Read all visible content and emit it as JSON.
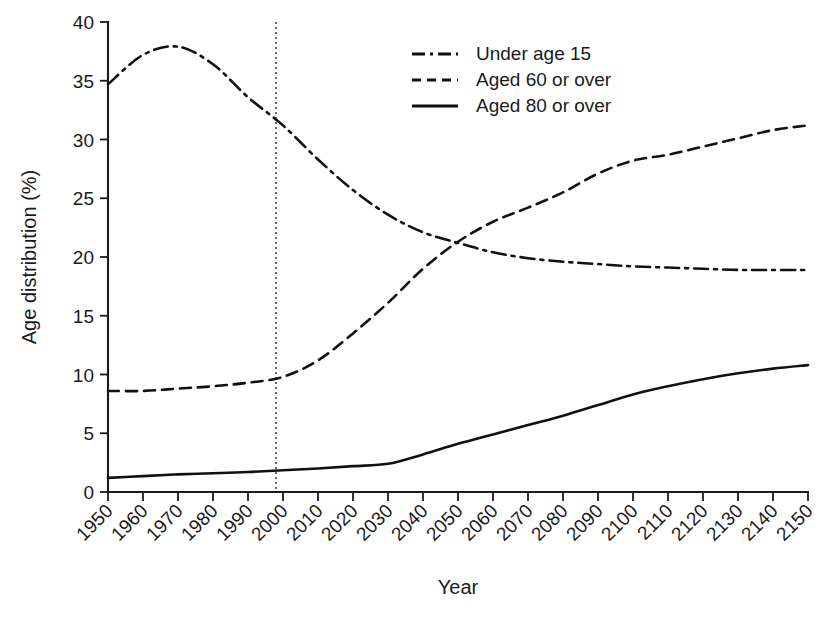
{
  "chart_data": {
    "type": "line",
    "title": "",
    "xlabel": "Year",
    "ylabel": "Age distribution (%)",
    "xlim": [
      1950,
      2150
    ],
    "ylim": [
      0,
      40
    ],
    "yticks": [
      0,
      5,
      10,
      15,
      20,
      25,
      30,
      35,
      40
    ],
    "ytick_labels": [
      "0",
      "5",
      "10",
      "15",
      "20",
      "25",
      "30",
      "35",
      "40"
    ],
    "xticks": [
      1950,
      1960,
      1970,
      1980,
      1990,
      2000,
      2010,
      2020,
      2030,
      2040,
      2050,
      2060,
      2070,
      2080,
      2090,
      2100,
      2110,
      2120,
      2130,
      2140,
      2150
    ],
    "xtick_labels": [
      "1950",
      "1960",
      "1970",
      "1980",
      "1990",
      "2000",
      "2010",
      "2020",
      "2030",
      "2040",
      "2050",
      "2060",
      "2070",
      "2080",
      "2090",
      "2100",
      "2110",
      "2120",
      "2130",
      "2140",
      "2150"
    ],
    "grid": false,
    "legend_position": "top-right",
    "annotations": [
      {
        "name": "present-year-marker",
        "type": "vline",
        "x": 1998,
        "style": "dotted"
      }
    ],
    "x": [
      1950,
      1960,
      1970,
      1980,
      1990,
      2000,
      2010,
      2020,
      2030,
      2040,
      2050,
      2060,
      2070,
      2080,
      2090,
      2100,
      2110,
      2120,
      2130,
      2140,
      2150
    ],
    "series": [
      {
        "name": "Under age 15",
        "style": "dash-dot",
        "values": [
          34.7,
          37.2,
          37.9,
          36.4,
          33.6,
          31.2,
          28.3,
          25.7,
          23.6,
          22.1,
          21.2,
          20.4,
          19.9,
          19.6,
          19.4,
          19.2,
          19.1,
          19.0,
          18.9,
          18.9,
          18.9
        ]
      },
      {
        "name": "Aged 60 or over",
        "style": "dashed",
        "values": [
          8.6,
          8.6,
          8.8,
          9.0,
          9.3,
          9.8,
          11.2,
          13.5,
          16.1,
          19.0,
          21.3,
          23.0,
          24.2,
          25.5,
          27.1,
          28.2,
          28.7,
          29.4,
          30.1,
          30.8,
          31.2
        ]
      },
      {
        "name": "Aged 80 or over",
        "style": "solid",
        "values": [
          1.2,
          1.35,
          1.5,
          1.6,
          1.7,
          1.85,
          2.0,
          2.2,
          2.4,
          3.2,
          4.1,
          4.9,
          5.7,
          6.5,
          7.4,
          8.3,
          9.0,
          9.6,
          10.1,
          10.5,
          10.8
        ]
      }
    ],
    "legend": [
      {
        "label": "Under age 15",
        "style": "dash-dot"
      },
      {
        "label": "Aged 60 or over",
        "style": "dashed"
      },
      {
        "label": "Aged 80 or over",
        "style": "solid"
      }
    ]
  }
}
